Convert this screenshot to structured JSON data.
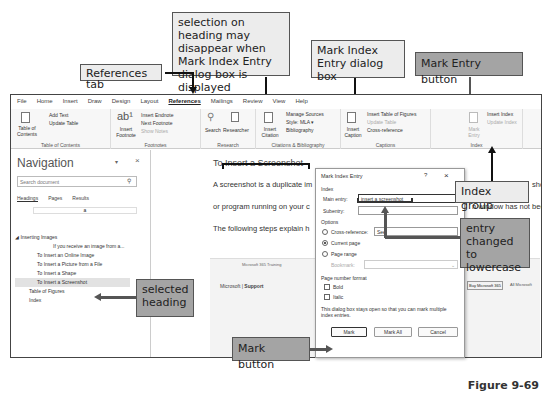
{
  "figure_label": "Figure 9-69",
  "callouts": {
    "selection_note": "selection on heading may disappear when Mark Index Entry dialog box is displayed",
    "references_tab": "References tab",
    "mark_index_dialog": "Mark Index Entry dialog box",
    "mark_entry_button": "Mark Entry button",
    "index_group": "Index group",
    "entry_lowercase": "entry changed to lowercase",
    "selected_heading": "selected heading",
    "mark_button": "Mark button"
  },
  "menubar": [
    "File",
    "Home",
    "Insert",
    "Draw",
    "Design",
    "Layout",
    "References",
    "Mailings",
    "Review",
    "View",
    "Help"
  ],
  "ribbon": {
    "toc": {
      "big": "Table of Contents",
      "add_text": "Add Text",
      "update_table": "Update Table",
      "group": "Table of Contents"
    },
    "footnotes": {
      "big": "Insert Footnote",
      "insert_endnote": "Insert Endnote",
      "next_footnote": "Next Footnote",
      "show_notes": "Show Notes",
      "group": "Footnotes"
    },
    "research": {
      "search": "Search",
      "researcher": "Researcher",
      "group": "Research"
    },
    "citations": {
      "big": "Insert Citation",
      "manage_sources": "Manage Sources",
      "style_label": "Style:",
      "style_value": "MLA",
      "bibliography": "Bibliography",
      "group": "Citations & Bibliography"
    },
    "captions": {
      "big": "Insert Caption",
      "insert_tof": "Insert Table of Figures",
      "update_table": "Update Table",
      "cross_reference": "Cross-reference",
      "group": "Captions"
    },
    "index": {
      "big": "Mark Entry",
      "insert_index": "Insert Index",
      "update_index": "Update Index",
      "group": "Index"
    }
  },
  "navigation": {
    "title": "Navigation",
    "search_placeholder": "Search document",
    "tabs": [
      "Headings",
      "Pages",
      "Results"
    ],
    "bar_value": "a",
    "items": [
      {
        "label": "Inserting Images",
        "level": 0
      },
      {
        "label": "If you receive an image from a...",
        "level": 2
      },
      {
        "label": "To Insert an Online Image",
        "level": 1
      },
      {
        "label": "To Insert a Picture from a File",
        "level": 1
      },
      {
        "label": "To Insert a Shape",
        "level": 1
      },
      {
        "label": "To Insert a Screenshot",
        "level": 1,
        "selected": true
      },
      {
        "label": "Table of Figures",
        "level": 0
      },
      {
        "label": "Index",
        "level": 0
      }
    ]
  },
  "document": {
    "heading": "To Insert a Screenshot",
    "lines": [
      "A screenshot is a duplicate im",
      "or program running on your c",
      "The following steps explain h"
    ],
    "right_lines": [
      "sho",
      "n window has not been",
      "f",
      "w"
    ],
    "browser": {
      "tab": "Microsoft 365 Training",
      "brand": "Microsoft",
      "support": "Support",
      "buy": "Buy Microsoft 365",
      "all": "All Microsoft"
    }
  },
  "dialog": {
    "title": "Mark Index Entry",
    "help": "?",
    "close": "×",
    "index_label": "Index",
    "main_entry_label": "Main entry:",
    "main_entry_value": "insert a screenshot",
    "subentry_label": "Subentry:",
    "subentry_value": "",
    "options_label": "Options",
    "cross_reference_label": "Cross-reference:",
    "cross_reference_value": "See",
    "current_page_label": "Current page",
    "page_range_label": "Page range",
    "bookmark_label": "Bookmark:",
    "page_number_format_label": "Page number format",
    "bold_label": "Bold",
    "italic_label": "Italic",
    "note": "This dialog box stays open so that you can mark multiple index entries.",
    "mark_button": "Mark",
    "mark_all_button": "Mark All",
    "cancel_button": "Cancel"
  }
}
